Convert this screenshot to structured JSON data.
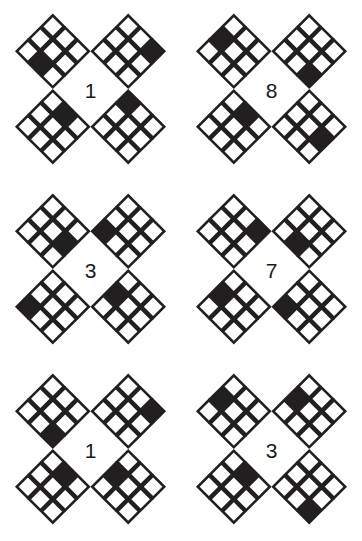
{
  "sheet": {
    "title": "Diamond Grid Matrix Puzzle",
    "background_color": "#ffffff",
    "ink_color": "#211f1f",
    "fill_color": "#211f1f",
    "cell_face_color": "#ffffff",
    "columns": 2,
    "rows": 3,
    "group_width": 181,
    "group_height": 180
  },
  "legend": {
    "note": "Each group shows four 3x3 diamond (45deg rotated) grids arranged around a centered digit. Exactly one cell is filled black in each diamond."
  },
  "groups": [
    {
      "id": "group-1",
      "label": "1",
      "position": {
        "col": 0,
        "row": 0
      },
      "diamonds": [
        {
          "id": "g1-top-left",
          "corner": "top-left",
          "filled": [
            2,
            1
          ]
        },
        {
          "id": "g1-top-right",
          "corner": "top-right",
          "filled": [
            0,
            2
          ]
        },
        {
          "id": "g1-bottom-left",
          "corner": "bottom-left",
          "filled": [
            0,
            1
          ]
        },
        {
          "id": "g1-bottom-right",
          "corner": "bottom-right",
          "filled": [
            0,
            0
          ]
        }
      ]
    },
    {
      "id": "group-2",
      "label": "8",
      "position": {
        "col": 1,
        "row": 0
      },
      "diamonds": [
        {
          "id": "g2-top-left",
          "corner": "top-left",
          "filled": [
            1,
            0
          ]
        },
        {
          "id": "g2-top-right",
          "corner": "top-right",
          "filled": [
            2,
            2
          ]
        },
        {
          "id": "g2-bottom-left",
          "corner": "bottom-left",
          "filled": [
            0,
            1
          ]
        },
        {
          "id": "g2-bottom-right",
          "corner": "bottom-right",
          "filled": [
            1,
            2
          ]
        }
      ]
    },
    {
      "id": "group-3",
      "label": "3",
      "position": {
        "col": 0,
        "row": 1
      },
      "diamonds": [
        {
          "id": "g3-top-left",
          "corner": "top-left",
          "filled": [
            1,
            2
          ]
        },
        {
          "id": "g3-top-right",
          "corner": "top-right",
          "filled": [
            2,
            0
          ]
        },
        {
          "id": "g3-bottom-left",
          "corner": "bottom-left",
          "filled": [
            2,
            0
          ]
        },
        {
          "id": "g3-bottom-right",
          "corner": "bottom-right",
          "filled": [
            1,
            0
          ]
        }
      ]
    },
    {
      "id": "group-4",
      "label": "7",
      "position": {
        "col": 1,
        "row": 1
      },
      "diamonds": [
        {
          "id": "g4-top-left",
          "corner": "top-left",
          "filled": [
            0,
            2
          ]
        },
        {
          "id": "g4-top-right",
          "corner": "top-right",
          "filled": [
            2,
            1
          ]
        },
        {
          "id": "g4-bottom-left",
          "corner": "bottom-left",
          "filled": [
            1,
            0
          ]
        },
        {
          "id": "g4-bottom-right",
          "corner": "bottom-right",
          "filled": [
            2,
            0
          ]
        }
      ]
    },
    {
      "id": "group-5",
      "label": "1",
      "position": {
        "col": 0,
        "row": 2
      },
      "diamonds": [
        {
          "id": "g5-top-left",
          "corner": "top-left",
          "filled": [
            2,
            2
          ]
        },
        {
          "id": "g5-top-right",
          "corner": "top-right",
          "filled": [
            0,
            2
          ]
        },
        {
          "id": "g5-bottom-left",
          "corner": "bottom-left",
          "filled": [
            0,
            1
          ]
        },
        {
          "id": "g5-bottom-right",
          "corner": "bottom-right",
          "filled": [
            1,
            0
          ]
        }
      ]
    },
    {
      "id": "group-6",
      "label": "3",
      "position": {
        "col": 1,
        "row": 2
      },
      "diamonds": [
        {
          "id": "g6-top-left",
          "corner": "top-left",
          "filled": [
            1,
            0
          ]
        },
        {
          "id": "g6-top-right",
          "corner": "top-right",
          "filled": [
            1,
            0
          ]
        },
        {
          "id": "g6-bottom-left",
          "corner": "bottom-left",
          "filled": [
            0,
            1
          ]
        },
        {
          "id": "g6-bottom-right",
          "corner": "bottom-right",
          "filled": [
            2,
            2
          ]
        }
      ]
    }
  ]
}
